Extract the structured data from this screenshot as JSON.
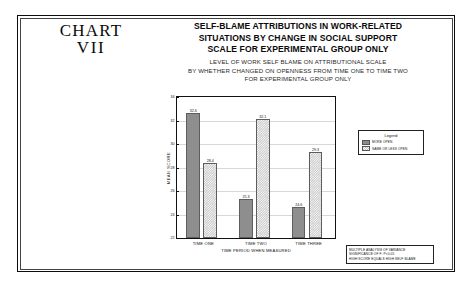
{
  "chart_label": {
    "line1": "CHART",
    "line2": "VII"
  },
  "header": {
    "title_lines": [
      "SELF-BLAME ATTRIBUTIONS IN WORK-RELATED",
      "SITUATIONS BY CHANGE IN SOCIAL SUPPORT",
      "SCALE FOR EXPERIMENTAL GROUP ONLY"
    ],
    "subtitle_lines": [
      "LEVEL OF WORK SELF BLAME ON ATTRIBUTIONAL SCALE",
      "BY WHETHER CHANGED ON OPENNESS FROM TIME ONE TO TIME TWO",
      "FOR EXPERIMENTAL GROUP ONLY"
    ]
  },
  "legend": {
    "title": "Legend",
    "entries": [
      {
        "label": "MORE OPEN",
        "color": "#8e8e8e"
      },
      {
        "label": "SAME OR LESS OPEN",
        "color": "#c9c9c9"
      }
    ]
  },
  "footnote": {
    "lines": [
      "MULTIPLE ANALYSIS OF VARIANCE",
      "SIGNIFICANCE OF F: P<0.05",
      "HIGH SCORE EQUALS HIGH SELF BLAME"
    ]
  },
  "chart_data": {
    "type": "bar",
    "title": "SELF-BLAME ATTRIBUTIONS IN WORK-RELATED SITUATIONS BY CHANGE IN SOCIAL SUPPORT SCALE FOR EXPERIMENTAL GROUP ONLY",
    "subtitle": "LEVEL OF WORK SELF BLAME ON ATTRIBUTIONAL SCALE BY WHETHER CHANGED ON OPENNESS FROM TIME ONE TO TIME TWO FOR EXPERIMENTAL GROUP ONLY",
    "categories": [
      "TIME ONE",
      "TIME TWO",
      "TIME THREE"
    ],
    "series": [
      {
        "name": "MORE OPEN",
        "values": [
          32.6,
          25.3,
          24.6
        ]
      },
      {
        "name": "SAME OR LESS OPEN",
        "values": [
          28.4,
          32.1,
          29.3
        ]
      }
    ],
    "xlabel": "TIME PERIOD WHEN MEASURED",
    "ylabel": "MEAN SCORE",
    "ylim": [
      22,
      34
    ],
    "yticks": [
      22,
      24,
      26,
      28,
      30,
      32,
      34
    ],
    "grid": true,
    "legend_position": "right"
  }
}
